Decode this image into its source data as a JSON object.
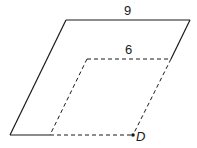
{
  "diagram": {
    "type": "parallelogram-translation",
    "outer_shape": {
      "top_side_label": "9",
      "style": "solid"
    },
    "inner_shape": {
      "top_side_label": "6",
      "style": "dashed"
    },
    "point": {
      "label": "D"
    },
    "colors": {
      "stroke": "#1a1a1a",
      "background": "#ffffff"
    }
  }
}
